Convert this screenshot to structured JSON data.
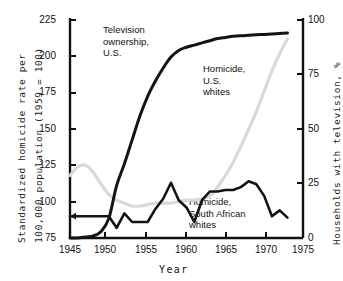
{
  "chart_data": {
    "type": "line",
    "title": "",
    "xlabel": "Year",
    "ylabel_left": "Standardized homicide rate per 100,000 population (1959 = 100)",
    "ylabel_right": "Households with television, %",
    "xlim": [
      1945,
      1975
    ],
    "ylim_left": [
      75,
      225
    ],
    "ylim_right": [
      0,
      100
    ],
    "xticks": [
      1945,
      1950,
      1955,
      1960,
      1965,
      1970,
      1975
    ],
    "yticks_left": [
      75,
      100,
      125,
      150,
      175,
      200,
      225
    ],
    "yticks_right": [
      0,
      25,
      50,
      75,
      100
    ],
    "grid": false,
    "legend_position": "inline-annotations",
    "series": [
      {
        "name": "Television ownership, U.S.",
        "axis": "right",
        "color": "#141414",
        "annotation": "Television ownership,\nU.S.",
        "x": [
          1945,
          1946,
          1947,
          1948,
          1949,
          1950,
          1951,
          1952,
          1953,
          1954,
          1955,
          1956,
          1957,
          1958,
          1959,
          1960,
          1961,
          1962,
          1963,
          1964,
          1965,
          1966,
          1967,
          1968,
          1969,
          1970,
          1971,
          1972,
          1973
        ],
        "values": [
          0,
          0,
          0.5,
          1,
          3,
          9,
          24,
          34,
          45,
          56,
          65,
          72,
          78,
          83,
          86,
          87.5,
          88.5,
          89.5,
          90.5,
          91.5,
          92,
          92.5,
          92.8,
          93,
          93.2,
          93.4,
          93.6,
          93.8,
          94
        ]
      },
      {
        "name": "Homicide, U.S. whites",
        "axis": "left",
        "color": "#d9d9d9",
        "annotation": "Homicide,\nU.S.\nwhites",
        "x": [
          1945,
          1946,
          1947,
          1948,
          1949,
          1950,
          1951,
          1952,
          1953,
          1954,
          1955,
          1956,
          1957,
          1958,
          1959,
          1960,
          1961,
          1962,
          1963,
          1964,
          1965,
          1966,
          1967,
          1968,
          1969,
          1970,
          1971,
          1972,
          1973
        ],
        "values": [
          118,
          124,
          125,
          120,
          112,
          105,
          101,
          99,
          97,
          97,
          98,
          99,
          99,
          99,
          100,
          101,
          101,
          102,
          104,
          110,
          118,
          127,
          138,
          150,
          162,
          176,
          190,
          202,
          212
        ]
      },
      {
        "name": "Homicide, South African whites",
        "axis": "left",
        "color": "#141414",
        "annotation": "Homicide,\nSouth African\nwhites",
        "x": [
          1945,
          1946,
          1947,
          1948,
          1949,
          1950,
          1951,
          1952,
          1953,
          1954,
          1955,
          1956,
          1957,
          1958,
          1959,
          1960,
          1961,
          1962,
          1963,
          1964,
          1965,
          1966,
          1967,
          1968,
          1969,
          1970,
          1971,
          1972,
          1973
        ],
        "values": [
          90,
          90,
          90,
          90,
          90,
          90,
          82,
          92,
          86,
          86,
          86,
          95,
          102,
          113,
          101,
          96,
          86,
          101,
          107,
          107,
          108,
          108,
          110,
          114,
          112,
          104,
          90,
          94,
          89
        ]
      }
    ],
    "annotations": [
      {
        "text_line1": "Television",
        "text_line2": "ownership,",
        "text_line3": "U.S."
      },
      {
        "text_line1": "Homicide,",
        "text_line2": "U.S.",
        "text_line3": "whites"
      },
      {
        "text_line1": "Homicide,",
        "text_line2": "South African",
        "text_line3": "whites"
      }
    ],
    "colors": {
      "tv_line": "#141414",
      "us_whites_line": "#d9d9d9",
      "sa_whites_line": "#141414",
      "axis": "#111111",
      "background": "#ffffff"
    }
  },
  "labels": {
    "xtick_1945": "1945",
    "xtick_1950": "1950",
    "xtick_1955": "1955",
    "xtick_1960": "1960",
    "xtick_1965": "1965",
    "xtick_1970": "1970",
    "xtick_1975": "1975",
    "ytick_left_75": "75",
    "ytick_left_100": "100",
    "ytick_left_125": "125",
    "ytick_left_150": "150",
    "ytick_left_175": "175",
    "ytick_left_200": "200",
    "ytick_left_225": "225",
    "ytick_right_0": "0",
    "ytick_right_25": "25",
    "ytick_right_50": "50",
    "ytick_right_75": "75",
    "ytick_right_100": "100",
    "xaxis_title": "Year",
    "yaxis_left_line1": "Standardized homicide rate per",
    "yaxis_left_line2": "100,000 population (1959 = 100)",
    "yaxis_right": "Households with television, %",
    "annot_tv_l1": "Television",
    "annot_tv_l2": "ownership,",
    "annot_tv_l3": "U.S.",
    "annot_us_l1": "Homicide,",
    "annot_us_l2": "U.S.",
    "annot_us_l3": "whites",
    "annot_sa_l1": "Homicide,",
    "annot_sa_l2": "South African",
    "annot_sa_l3": "whites"
  }
}
